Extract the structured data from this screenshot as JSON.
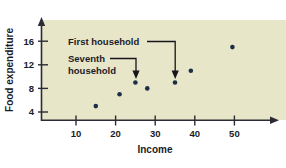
{
  "chart_data": {
    "type": "scatter",
    "title": "",
    "xlabel": "Income",
    "ylabel": "Food expenditure",
    "xlim": [
      0,
      62
    ],
    "ylim": [
      0,
      18
    ],
    "xticks": [
      10,
      20,
      30,
      40,
      50
    ],
    "yticks": [
      4,
      8,
      12,
      16
    ],
    "xtick_labels": [
      "10",
      "20",
      "30",
      "40",
      "50"
    ],
    "ytick_labels": [
      "4",
      "8",
      "12",
      "16"
    ],
    "grid": false,
    "legend": "none",
    "point_color": "#1d2f47",
    "plot_background": "#e8e6c8",
    "x": [
      15,
      21,
      25,
      28,
      35,
      39,
      49.5
    ],
    "y": [
      5,
      7,
      9,
      8,
      9,
      11,
      15
    ],
    "points": [
      {
        "income": 15,
        "food_expenditure": 5
      },
      {
        "income": 21,
        "food_expenditure": 7
      },
      {
        "income": 25,
        "food_expenditure": 9,
        "annotation": "Seventh household"
      },
      {
        "income": 28,
        "food_expenditure": 8
      },
      {
        "income": 35,
        "food_expenditure": 9,
        "annotation": "First household"
      },
      {
        "income": 39,
        "food_expenditure": 11
      },
      {
        "income": 49.5,
        "food_expenditure": 15
      }
    ],
    "annotations": [
      {
        "label": "First household",
        "target_x": 35,
        "target_y": 9
      },
      {
        "label": "Seventh household",
        "target_x": 25,
        "target_y": 9
      }
    ]
  },
  "labels": {
    "y_axis_title": "Food expenditure",
    "x_axis_title": "Income",
    "ytick_0": "4",
    "ytick_1": "8",
    "ytick_2": "12",
    "ytick_3": "16",
    "xtick_0": "10",
    "xtick_1": "20",
    "xtick_2": "30",
    "xtick_3": "40",
    "xtick_4": "50",
    "annotation_first_line1": "First household",
    "annotation_seventh_line1": "Seventh",
    "annotation_seventh_line2": "household"
  }
}
